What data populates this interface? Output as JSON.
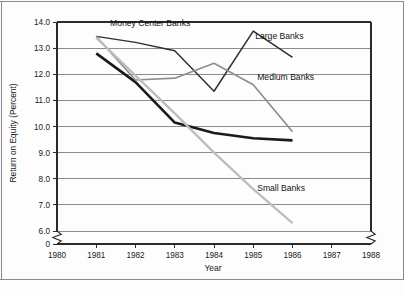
{
  "chart_data": {
    "type": "line",
    "title": "",
    "subtitle": "",
    "xlabel": "Year",
    "ylabel": "Return on Equity (Percent)",
    "x": [
      1981,
      1982,
      1983,
      1984,
      1985,
      1986
    ],
    "x_tick_labels": [
      "1980",
      "1981",
      "1982",
      "1983",
      "1984",
      "1985",
      "1986",
      "1987",
      "1988"
    ],
    "x_ticks": [
      1980,
      1981,
      1982,
      1983,
      1984,
      1985,
      1986,
      1987,
      1988
    ],
    "xlim": [
      1980,
      1988
    ],
    "y_tick_labels": [
      "0",
      "6.0",
      "7.0",
      "8.0",
      "9.0",
      "10.0",
      "11.0",
      "12.0",
      "13.0",
      "14.0"
    ],
    "y_ticks": [
      0,
      6.0,
      7.0,
      8.0,
      9.0,
      10.0,
      11.0,
      12.0,
      13.0,
      14.0
    ],
    "ylim": [
      6.0,
      14.0
    ],
    "y_axis_break": true,
    "x_axis_break": true,
    "grid": "horizontal",
    "legend_position": "inline-labels",
    "series": [
      {
        "name": "Large Banks",
        "color": "#2f2f2f",
        "width": 1.5,
        "values": [
          13.45,
          13.22,
          12.9,
          11.35,
          13.65,
          12.65
        ],
        "label": "Large Banks",
        "label_x": 1985.05,
        "label_y": 13.35
      },
      {
        "name": "Money Center Banks",
        "color": "#1a1a1a",
        "width": 2.6,
        "values": [
          12.8,
          11.7,
          10.15,
          9.75,
          9.55,
          9.47
        ],
        "label": "Money Center Banks",
        "label_x": 1981.35,
        "label_y": 13.85
      },
      {
        "name": "Medium Banks",
        "color": "#8e8e8e",
        "width": 1.7,
        "values": [
          13.45,
          11.78,
          11.85,
          12.42,
          11.6,
          9.8
        ],
        "label": "Medium Banks",
        "label_x": 1985.1,
        "label_y": 11.78
      },
      {
        "name": "Small Banks",
        "color": "#bdbdbd",
        "width": 2.3,
        "values": [
          13.4,
          11.95,
          10.5,
          9.0,
          7.6,
          6.3
        ],
        "label": "Small Banks",
        "label_x": 1985.1,
        "label_y": 7.55
      }
    ]
  },
  "axes": {
    "ylabel": "Return on Equity (Percent)",
    "xlabel": "Year",
    "zero_label": "0"
  }
}
